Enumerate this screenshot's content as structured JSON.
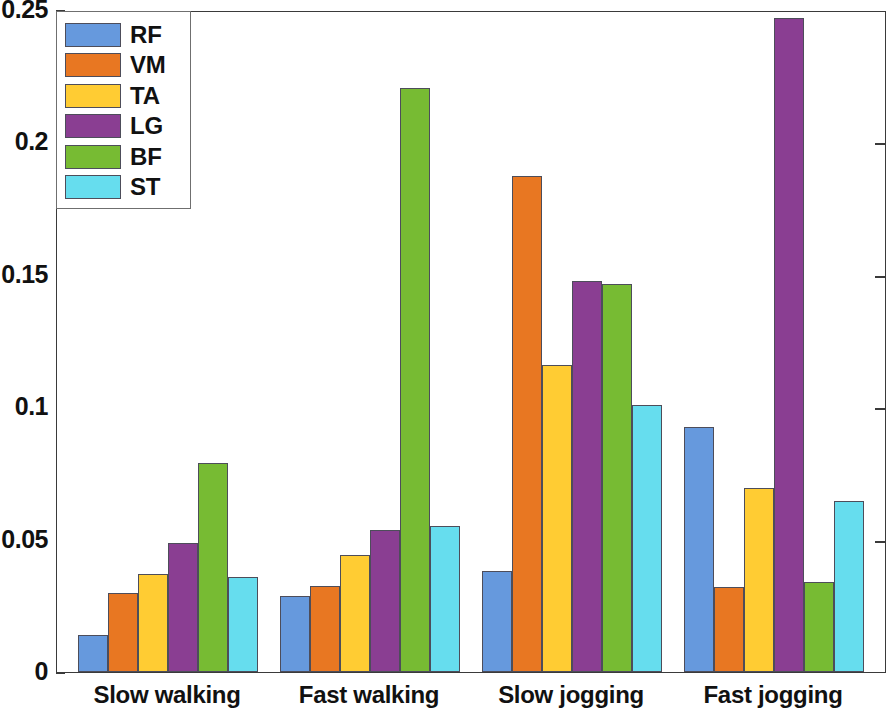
{
  "chart_data": {
    "type": "bar",
    "title": "",
    "subtitle": "",
    "xlabel": "",
    "ylabel": "",
    "categories": [
      "Slow walking",
      "Fast walking",
      "Slow jogging",
      "Fast jogging"
    ],
    "series": [
      {
        "name": "RF",
        "color": "#6699dd",
        "values": [
          0.0139,
          0.0287,
          0.0383,
          0.0925
        ]
      },
      {
        "name": "VM",
        "color": "#e87722",
        "values": [
          0.0298,
          0.0325,
          0.1873,
          0.0321
        ]
      },
      {
        "name": "TA",
        "color": "#ffcc33",
        "values": [
          0.0372,
          0.0441,
          0.1159,
          0.0695
        ]
      },
      {
        "name": "LG",
        "color": "#8a3e92",
        "values": [
          0.0489,
          0.0537,
          0.1476,
          0.2468
        ]
      },
      {
        "name": "BF",
        "color": "#77bb33",
        "values": [
          0.0789,
          0.2205,
          0.1465,
          0.034
        ]
      },
      {
        "name": "ST",
        "color": "#66ddee",
        "values": [
          0.0359,
          0.0553,
          0.101,
          0.0645
        ]
      }
    ],
    "ylim": [
      0,
      0.25
    ],
    "yticks": [
      0,
      0.05,
      0.1,
      0.15,
      0.2,
      0.25
    ],
    "ytick_labels": [
      "0",
      "0.05",
      "0.1",
      "0.15",
      "0.2",
      "0.25"
    ],
    "grid": false,
    "legend_position": "top-left",
    "legend_entries": [
      "RF",
      "VM",
      "TA",
      "LG",
      "BF",
      "ST"
    ]
  },
  "axes": {
    "y_tick_labels": [
      "0.25",
      "0.2",
      "0.15",
      "0.1",
      "0.05",
      "0"
    ],
    "x_group_labels": [
      "Slow walking",
      "Fast walking",
      "Slow jogging",
      "Fast jogging"
    ]
  },
  "legend": {
    "items": [
      {
        "label": "RF"
      },
      {
        "label": "VM"
      },
      {
        "label": "TA"
      },
      {
        "label": "LG"
      },
      {
        "label": "BF"
      },
      {
        "label": "ST"
      }
    ]
  }
}
